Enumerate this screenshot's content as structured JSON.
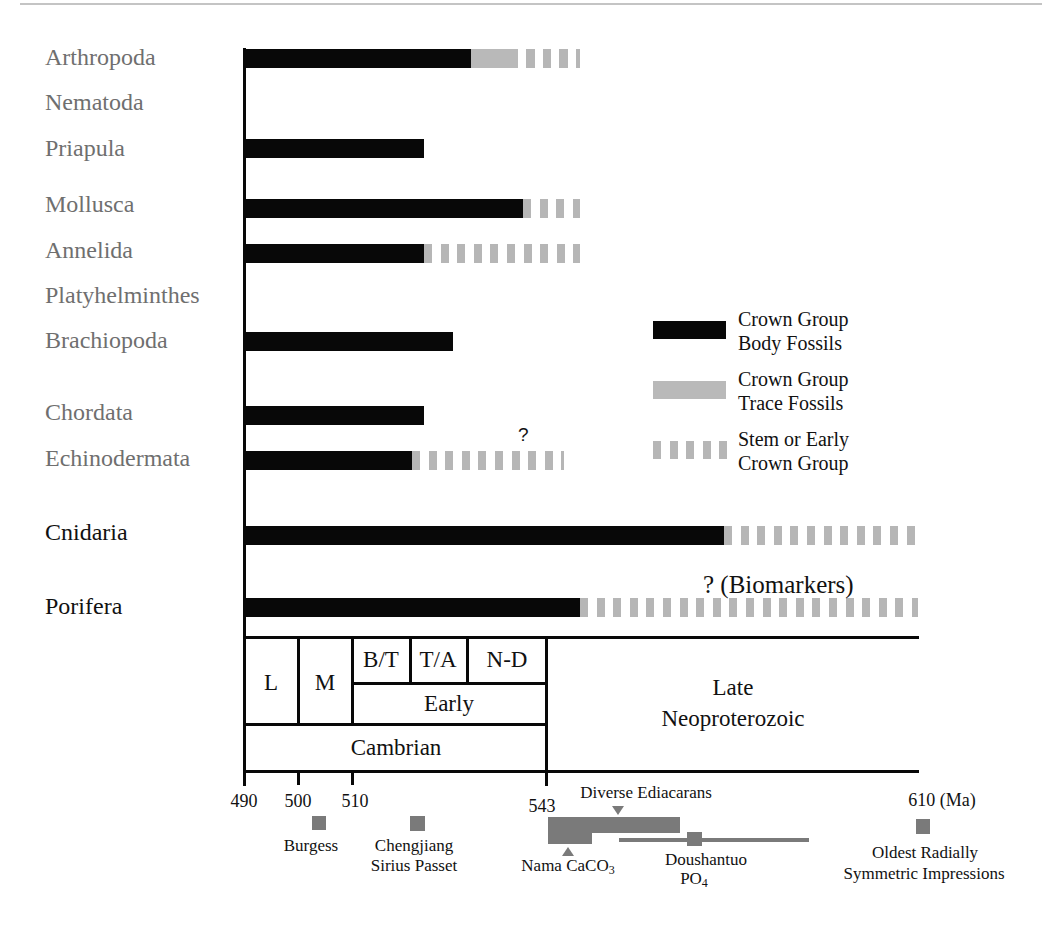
{
  "legend": {
    "items": [
      {
        "type": "body",
        "line1": "Crown Group",
        "line2": "Body Fossils"
      },
      {
        "type": "trace",
        "line1": "Crown Group",
        "line2": "Trace Fossils"
      },
      {
        "type": "stem",
        "line1": "Stem or Early",
        "line2": "Crown Group"
      }
    ]
  },
  "annotations": {
    "echinodermata_question": "?",
    "porifera_biomarkers": "? (Biomarkers)"
  },
  "timescale": {
    "L": "L",
    "M": "M",
    "BT": "B/T",
    "TA": "T/A",
    "ND": "N-D",
    "early": "Early",
    "cambrian": "Cambrian",
    "late_line1": "Late",
    "late_line2": "Neoproterozoic"
  },
  "axis": {
    "ticks": [
      "490",
      "500",
      "510",
      "543",
      "610 (Ma)"
    ]
  },
  "events": {
    "burgess": "Burgess",
    "chengjiang_line1": "Chengjiang",
    "chengjiang_line2": "Sirius Passet",
    "diverse_ediacarans": "Diverse Ediacarans",
    "nama": {
      "text": "Nama CaCO",
      "sub": "3"
    },
    "doushantuo_line1": "Doushantuo",
    "doushantuo_line2": {
      "text": "PO",
      "sub": "4"
    },
    "oldest_line1": "Oldest Radially",
    "oldest_line2": "Symmetric Impressions"
  },
  "colors": {
    "body": "#080808",
    "trace": "#b9b9b9",
    "stem": "#b6b6b6",
    "marker": "#7a7a7a",
    "label_gray": "#6f6f6f"
  },
  "chart_data": {
    "type": "bar",
    "orientation": "horizontal-range",
    "title": "",
    "xlabel": "Ma",
    "x_direction": "increasing age to the right",
    "xlim": [
      490,
      610
    ],
    "x_ticks": [
      490,
      500,
      510,
      543,
      610
    ],
    "categories": [
      "Arthropoda",
      "Nematoda",
      "Priapula",
      "Mollusca",
      "Annelida",
      "Platyhelminthes",
      "Brachiopoda",
      "Chordata",
      "Echinodermata",
      "Cnidaria",
      "Porifera"
    ],
    "legend": [
      "Crown Group Body Fossils",
      "Crown Group Trace Fossils",
      "Stem or Early Crown Group"
    ],
    "legend_position": "right",
    "rows": [
      {
        "name": "Arthropoda",
        "segments": [
          {
            "type": "body",
            "from": 490,
            "to": 530
          },
          {
            "type": "trace",
            "from": 530,
            "to": 538
          },
          {
            "type": "stem",
            "from": 538,
            "to": 549
          }
        ]
      },
      {
        "name": "Nematoda",
        "segments": []
      },
      {
        "name": "Priapula",
        "segments": [
          {
            "type": "body",
            "from": 490,
            "to": 522
          }
        ]
      },
      {
        "name": "Mollusca",
        "segments": [
          {
            "type": "body",
            "from": 490,
            "to": 539
          },
          {
            "type": "stem",
            "from": 539,
            "to": 549
          }
        ]
      },
      {
        "name": "Annelida",
        "segments": [
          {
            "type": "body",
            "from": 490,
            "to": 522
          },
          {
            "type": "stem",
            "from": 522,
            "to": 549
          }
        ]
      },
      {
        "name": "Platyhelminthes",
        "segments": []
      },
      {
        "name": "Brachiopoda",
        "segments": [
          {
            "type": "body",
            "from": 490,
            "to": 527
          }
        ]
      },
      {
        "name": "Chordata",
        "segments": [
          {
            "type": "body",
            "from": 490,
            "to": 522
          }
        ]
      },
      {
        "name": "Echinodermata",
        "segments": [
          {
            "type": "body",
            "from": 490,
            "to": 520
          },
          {
            "type": "stem",
            "from": 520,
            "to": 546
          }
        ],
        "annotation": "?"
      },
      {
        "name": "Cnidaria",
        "segments": [
          {
            "type": "body",
            "from": 490,
            "to": 575
          },
          {
            "type": "stem",
            "from": 575,
            "to": 610
          }
        ]
      },
      {
        "name": "Porifera",
        "segments": [
          {
            "type": "body",
            "from": 490,
            "to": 549
          },
          {
            "type": "stem",
            "from": 549,
            "to": 610
          }
        ],
        "annotation": "? (Biomarkers)"
      }
    ],
    "timescale": [
      {
        "label": "L",
        "from": 490,
        "to": 500
      },
      {
        "label": "M",
        "from": 500,
        "to": 510
      },
      {
        "label": "B/T",
        "from": 510,
        "to": 520
      },
      {
        "label": "T/A",
        "from": 520,
        "to": 530
      },
      {
        "label": "N-D",
        "from": 530,
        "to": 543
      },
      {
        "label": "Early",
        "from": 510,
        "to": 543
      },
      {
        "label": "Cambrian",
        "from": 490,
        "to": 543
      },
      {
        "label": "Late Neoproterozoic",
        "from": 543,
        "to": 610
      }
    ],
    "events": [
      {
        "label": "Burgess",
        "ma": 505,
        "marker": "square"
      },
      {
        "label": "Chengjiang / Sirius Passet",
        "ma": 522,
        "marker": "square"
      },
      {
        "label": "Diverse Ediacarans",
        "ma": 555,
        "marker": "triangle-down"
      },
      {
        "label": "Nama CaCO3",
        "ma": 547,
        "marker": "triangle-up",
        "range": [
          543,
          567
        ]
      },
      {
        "label": "Doushantuo PO4",
        "ma": 568,
        "marker": "square",
        "range": [
          556,
          590
        ]
      },
      {
        "label": "Oldest Radially Symmetric Impressions",
        "ma": 610,
        "marker": "square"
      }
    ]
  }
}
